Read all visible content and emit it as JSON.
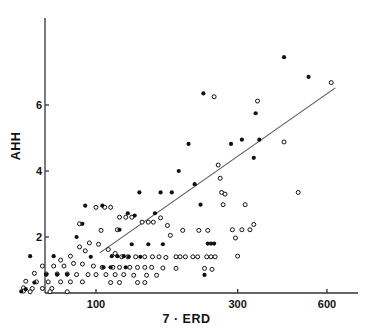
{
  "chart_data": {
    "type": "scatter",
    "title": "",
    "xlabel": "7 · ERD",
    "ylabel": "AHH",
    "xscale": "log",
    "yscale": "linear",
    "xlim": [
      55,
      700
    ],
    "ylim": [
      0.3,
      7.6
    ],
    "grid": false,
    "legend": "none",
    "xticks": [
      100,
      300,
      600
    ],
    "xtick_labels": [
      "100",
      "300",
      "600"
    ],
    "yticks": [
      2,
      4,
      6
    ],
    "ytick_labels": [
      "2",
      "4",
      "6"
    ],
    "series": [
      {
        "name": "filled",
        "marker": "filled-circle",
        "color": "#111111",
        "points": [
          [
            430,
            7.45
          ],
          [
            520,
            6.85
          ],
          [
            230,
            6.35
          ],
          [
            345,
            5.75
          ],
          [
            205,
            4.82
          ],
          [
            285,
            4.82
          ],
          [
            310,
            4.95
          ],
          [
            355,
            4.95
          ],
          [
            340,
            4.4
          ],
          [
            190,
            4.0
          ],
          [
            215,
            3.6
          ],
          [
            225,
            2.98
          ],
          [
            140,
            3.35
          ],
          [
            165,
            3.35
          ],
          [
            180,
            3.35
          ],
          [
            92,
            2.95
          ],
          [
            105,
            2.95
          ],
          [
            128,
            2.72
          ],
          [
            135,
            2.65
          ],
          [
            158,
            2.72
          ],
          [
            90,
            2.4
          ],
          [
            86,
            2.0
          ],
          [
            120,
            2.22
          ],
          [
            132,
            1.78
          ],
          [
            150,
            1.78
          ],
          [
            168,
            1.78
          ],
          [
            238,
            1.8
          ],
          [
            244,
            1.8
          ],
          [
            250,
            1.8
          ],
          [
            60,
            1.42
          ],
          [
            72,
            1.42
          ],
          [
            113,
            1.42
          ],
          [
            118,
            1.42
          ],
          [
            124,
            1.42
          ],
          [
            141,
            1.4
          ],
          [
            129,
            1.4
          ],
          [
            106,
            1.08
          ],
          [
            112,
            1.08
          ],
          [
            126,
            1.08
          ],
          [
            232,
            0.85
          ],
          [
            68,
            0.86
          ],
          [
            74,
            0.86
          ],
          [
            80,
            0.86
          ],
          [
            62,
            0.62
          ],
          [
            58,
            0.42
          ],
          [
            56,
            0.35
          ],
          [
            96,
            1.4
          ]
        ]
      },
      {
        "name": "open",
        "marker": "open-circle",
        "color": "#111111",
        "points": [
          [
            620,
            6.68
          ],
          [
            250,
            6.25
          ],
          [
            350,
            6.12
          ],
          [
            258,
            4.18
          ],
          [
            262,
            3.78
          ],
          [
            265,
            3.35
          ],
          [
            272,
            3.3
          ],
          [
            430,
            4.88
          ],
          [
            480,
            3.35
          ],
          [
            318,
            2.98
          ],
          [
            268,
            2.98
          ],
          [
            310,
            2.22
          ],
          [
            330,
            2.22
          ],
          [
            288,
            2.22
          ],
          [
            295,
            1.97
          ],
          [
            300,
            1.42
          ],
          [
            340,
            2.38
          ],
          [
            196,
            2.2
          ],
          [
            222,
            2.2
          ],
          [
            238,
            2.2
          ],
          [
            100,
            2.9
          ],
          [
            107,
            2.9
          ],
          [
            112,
            2.9
          ],
          [
            120,
            2.6
          ],
          [
            126,
            2.6
          ],
          [
            132,
            2.6
          ],
          [
            88,
            2.4
          ],
          [
            143,
            2.45
          ],
          [
            150,
            2.45
          ],
          [
            156,
            2.45
          ],
          [
            118,
            2.22
          ],
          [
            104,
            2.2
          ],
          [
            165,
            2.58
          ],
          [
            174,
            2.35
          ],
          [
            178,
            2.05
          ],
          [
            95,
            1.82
          ],
          [
            102,
            1.78
          ],
          [
            88,
            1.7
          ],
          [
            92,
            1.58
          ],
          [
            110,
            1.62
          ],
          [
            116,
            1.5
          ],
          [
            122,
            1.4
          ],
          [
            128,
            1.4
          ],
          [
            136,
            1.4
          ],
          [
            146,
            1.4
          ],
          [
            155,
            1.4
          ],
          [
            163,
            1.4
          ],
          [
            172,
            1.38
          ],
          [
            186,
            1.4
          ],
          [
            192,
            1.4
          ],
          [
            200,
            1.4
          ],
          [
            212,
            1.4
          ],
          [
            220,
            1.4
          ],
          [
            236,
            1.4
          ],
          [
            244,
            1.4
          ],
          [
            252,
            1.4
          ],
          [
            82,
            1.42
          ],
          [
            76,
            1.3
          ],
          [
            84,
            1.2
          ],
          [
            90,
            1.18
          ],
          [
            98,
            1.12
          ],
          [
            105,
            1.08
          ],
          [
            114,
            1.08
          ],
          [
            120,
            1.08
          ],
          [
            130,
            1.08
          ],
          [
            138,
            1.08
          ],
          [
            146,
            1.08
          ],
          [
            154,
            1.08
          ],
          [
            168,
            1.06
          ],
          [
            186,
            1.05
          ],
          [
            232,
            1.05
          ],
          [
            246,
            1.02
          ],
          [
            66,
            1.12
          ],
          [
            72,
            1.12
          ],
          [
            78,
            1.12
          ],
          [
            62,
            0.9
          ],
          [
            68,
            0.88
          ],
          [
            74,
            0.88
          ],
          [
            80,
            0.88
          ],
          [
            86,
            0.86
          ],
          [
            94,
            0.86
          ],
          [
            100,
            0.86
          ],
          [
            108,
            0.86
          ],
          [
            116,
            0.86
          ],
          [
            124,
            0.86
          ],
          [
            134,
            0.84
          ],
          [
            148,
            0.84
          ],
          [
            160,
            0.84
          ],
          [
            58,
            0.66
          ],
          [
            63,
            0.64
          ],
          [
            69,
            0.64
          ],
          [
            76,
            0.64
          ],
          [
            82,
            0.64
          ],
          [
            90,
            0.64
          ],
          [
            112,
            0.62
          ],
          [
            120,
            0.62
          ],
          [
            138,
            0.62
          ],
          [
            146,
            0.62
          ],
          [
            57,
            0.46
          ],
          [
            61,
            0.44
          ],
          [
            66,
            0.44
          ],
          [
            71,
            0.44
          ],
          [
            57,
            0.36
          ],
          [
            60,
            0.34
          ],
          [
            70,
            0.34
          ],
          [
            80,
            0.34
          ]
        ]
      }
    ],
    "trendline": {
      "name": "regression-line",
      "color": "#555555",
      "x1": 103,
      "y1": 1.52,
      "x2": 640,
      "y2": 6.52
    }
  }
}
